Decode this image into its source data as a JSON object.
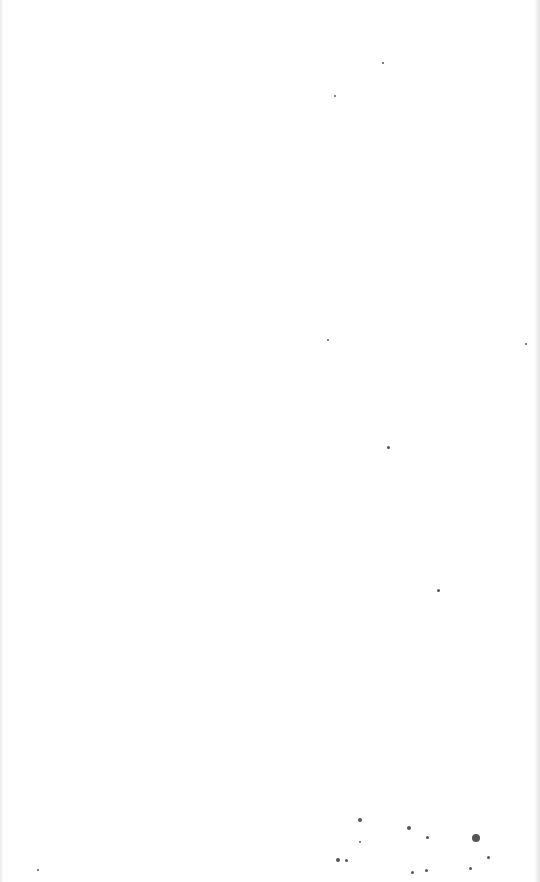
{
  "page": {
    "type": "blank scanned page",
    "background": "#ffffff",
    "specks": [
      {
        "x": 383,
        "y": 63,
        "r": 1.2
      },
      {
        "x": 335,
        "y": 96,
        "r": 1.2
      },
      {
        "x": 526,
        "y": 344,
        "r": 1.2
      },
      {
        "x": 328,
        "y": 340,
        "r": 1
      },
      {
        "x": 388,
        "y": 447,
        "r": 1.5
      },
      {
        "x": 438,
        "y": 590,
        "r": 1.5
      },
      {
        "x": 360,
        "y": 820,
        "r": 2
      },
      {
        "x": 409,
        "y": 828,
        "r": 2
      },
      {
        "x": 476,
        "y": 838,
        "r": 4
      },
      {
        "x": 338,
        "y": 860,
        "r": 2
      },
      {
        "x": 346,
        "y": 860,
        "r": 1.5
      },
      {
        "x": 427,
        "y": 837,
        "r": 1.5
      },
      {
        "x": 488,
        "y": 857,
        "r": 1.5
      },
      {
        "x": 470,
        "y": 868,
        "r": 1.5
      },
      {
        "x": 426,
        "y": 870,
        "r": 1.5
      },
      {
        "x": 412,
        "y": 872,
        "r": 1.5
      },
      {
        "x": 360,
        "y": 842,
        "r": 1.2
      },
      {
        "x": 38,
        "y": 870,
        "r": 1
      }
    ]
  }
}
